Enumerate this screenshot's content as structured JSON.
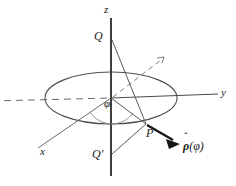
{
  "figure": {
    "background_color": "#ffffff",
    "line_color": "#555555",
    "axis_color": "#4a4a4a",
    "text_color": "#1a1a1a",
    "width": 236,
    "height": 186
  },
  "labels": {
    "z_axis": "z",
    "y_axis": "y",
    "x_axis": "x",
    "point_q": "Q",
    "point_q_prime": "Q′",
    "point_p": "P",
    "angle_phi": "φ",
    "unit_vector_rho": "ρ",
    "unit_vector_hat": "ˆ",
    "unit_vector_arg": "(φ)"
  },
  "geometry": {
    "origin": {
      "x": 111,
      "y": 98
    },
    "ellipse": {
      "cx": 111,
      "cy": 98,
      "rx": 66,
      "ry": 26
    },
    "z_axis": {
      "x1": 111,
      "y1": 18,
      "x2": 111,
      "y2": 176
    },
    "y_axis_solid": {
      "x1": 111,
      "y1": 98,
      "x2": 218,
      "y2": 94
    },
    "y_axis_dashed": {
      "x1": 4,
      "y1": 101,
      "x2": 111,
      "y2": 98
    },
    "x_axis": {
      "x1": 111,
      "y1": 98,
      "x2": 38,
      "y2": 148
    },
    "dashed_ray": {
      "x1": 111,
      "y1": 98,
      "x2": 163,
      "y2": 58
    },
    "point_q": {
      "x": 111,
      "y": 40
    },
    "point_q_prime": {
      "x": 111,
      "y": 155
    },
    "point_p": {
      "x": 145,
      "y": 124
    },
    "arrow": {
      "x1": 145,
      "y1": 124,
      "x2": 179,
      "y2": 143
    },
    "angle_arc_radius": 26
  }
}
